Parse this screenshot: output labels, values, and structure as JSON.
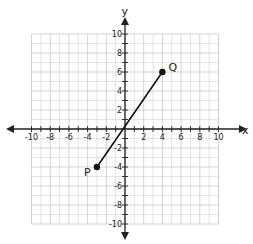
{
  "chart_data": {
    "type": "line",
    "title": "",
    "xlabel": "x",
    "ylabel": "y",
    "xlim": [
      -10,
      10
    ],
    "ylim": [
      -10,
      10
    ],
    "grid": true,
    "x_ticks": [
      -10,
      -8,
      -6,
      -4,
      -2,
      2,
      4,
      6,
      8,
      10
    ],
    "y_ticks": [
      10,
      8,
      6,
      4,
      2,
      -2,
      -4,
      -6,
      -8,
      -10
    ],
    "series": [
      {
        "name": "segment PQ",
        "points": [
          {
            "label": "P",
            "x": -3,
            "y": -4
          },
          {
            "label": "Q",
            "x": 4,
            "y": 6
          }
        ]
      }
    ],
    "colors": {
      "grid": "#c8c8c8",
      "axis": "#222222",
      "line": "#111111"
    }
  }
}
